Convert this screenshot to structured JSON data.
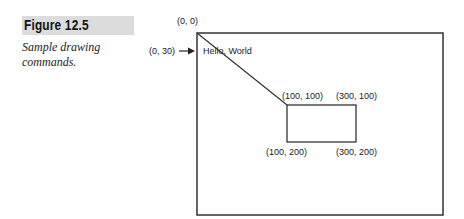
{
  "figure": {
    "label": "Figure 12.5",
    "caption": "Sample drawing commands."
  },
  "diagram": {
    "origin_label": "(0, 0)",
    "text_origin_label": "(0, 30)",
    "sample_text": "Hello, World",
    "rect_top_left": "(100, 100)",
    "rect_top_right": "(300, 100)",
    "rect_bottom_left": "(100, 200)",
    "rect_bottom_right": "(300, 200)",
    "line_color": "#333333"
  }
}
